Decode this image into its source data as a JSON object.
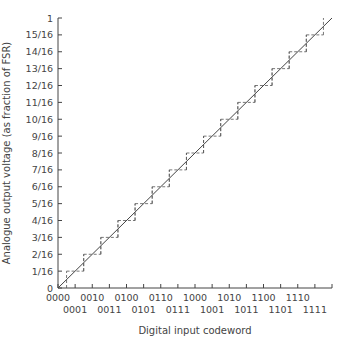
{
  "chart_data": {
    "type": "line",
    "title": "",
    "xlabel": "Digital input codeword",
    "ylabel": "Analogue output voltage (as fraction of FSR)",
    "x_ticks": [
      "0000",
      "0001",
      "0010",
      "0011",
      "0100",
      "0101",
      "0110",
      "0111",
      "1000",
      "1001",
      "1010",
      "1011",
      "1100",
      "1101",
      "1110",
      "1111"
    ],
    "y_ticks": [
      "0",
      "1/16",
      "2/16",
      "3/16",
      "4/16",
      "5/16",
      "6/16",
      "7/16",
      "8/16",
      "9/16",
      "10/16",
      "11/16",
      "12/16",
      "13/16",
      "14/16",
      "15/16",
      "1"
    ],
    "ylim": [
      0,
      1
    ],
    "grid": false,
    "series": [
      {
        "name": "Ideal transfer line",
        "style": "solid",
        "x": [
          0,
          16
        ],
        "y": [
          0,
          1
        ]
      },
      {
        "name": "Quantised output staircase",
        "style": "dashed",
        "x": [
          0,
          1,
          2,
          3,
          4,
          5,
          6,
          7,
          8,
          9,
          10,
          11,
          12,
          13,
          14,
          15
        ],
        "y": [
          0,
          0.0625,
          0.125,
          0.1875,
          0.25,
          0.3125,
          0.375,
          0.4375,
          0.5,
          0.5625,
          0.625,
          0.6875,
          0.75,
          0.8125,
          0.875,
          0.9375
        ]
      }
    ]
  },
  "axes": {
    "x_title": "Digital input codeword",
    "y_title": "Analogue output voltage (as fraction of FSR)"
  }
}
